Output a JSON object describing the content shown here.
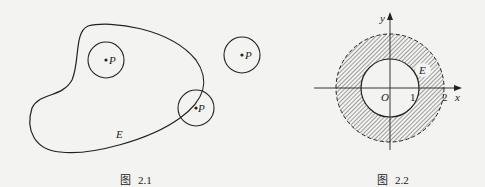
{
  "figures": [
    {
      "caption_prefix": "图",
      "caption_number": "2.1",
      "region_label": "E",
      "point_labels": [
        "P",
        "P",
        "P"
      ]
    },
    {
      "caption_prefix": "图",
      "caption_number": "2.2",
      "region_label": "E",
      "axis_x_label": "x",
      "axis_y_label": "y",
      "origin_label": "O",
      "tick_labels": [
        "1",
        "2"
      ]
    }
  ],
  "colors": {
    "ink": "#222222",
    "background": "#f3f3f1"
  }
}
